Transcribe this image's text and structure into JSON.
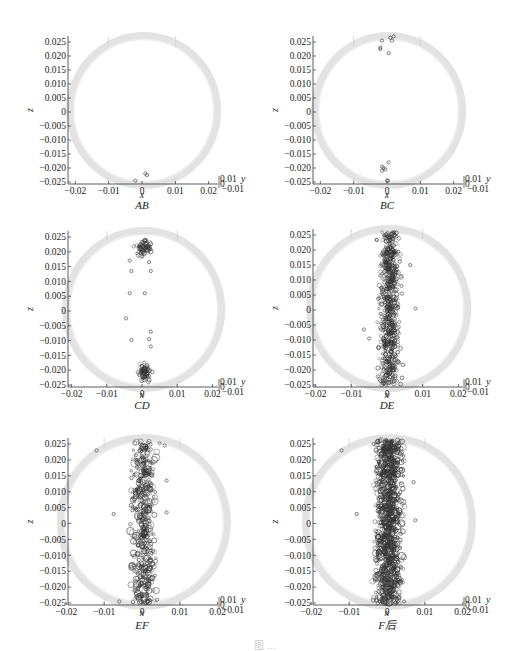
{
  "figure": {
    "caption": "图  …",
    "ring_color": "#d9d9d9",
    "marker_color": "#333333"
  },
  "chart_data": [
    {
      "type": "scatter",
      "title": "AB",
      "xlabel": "x",
      "ylabel": "z",
      "zlabel": "y",
      "xlim": [
        -0.026,
        0.026
      ],
      "ylim": [
        -0.026,
        0.027
      ],
      "xticks": [
        "-0.02",
        "-0.01",
        "0",
        "0.01",
        "0.02"
      ],
      "yticks": [
        "0.025",
        "0.020",
        "0.015",
        "0.010",
        "0.005",
        "0",
        "-0.005",
        "-0.010",
        "-0.015",
        "-0.020",
        "-0.025"
      ],
      "ytick_side": [
        "0.01",
        "0",
        "-0.01"
      ],
      "points": [
        [
          0.001,
          -0.022
        ],
        [
          0.0015,
          -0.0225
        ],
        [
          -0.002,
          -0.0245
        ]
      ],
      "clusters": []
    },
    {
      "type": "scatter",
      "title": "BC",
      "xlabel": "x",
      "ylabel": "z",
      "zlabel": "y",
      "xlim": [
        -0.026,
        0.026
      ],
      "ylim": [
        -0.026,
        0.027
      ],
      "xticks": [
        "-0.02",
        "-0.01",
        "0",
        "0.01",
        "0.02"
      ],
      "yticks": [
        "0.025",
        "0.020",
        "0.015",
        "0.010",
        "0.005",
        "0",
        "-0.005",
        "-0.010",
        "-0.015",
        "-0.020",
        "-0.025"
      ],
      "ytick_side": [
        "0.01",
        "0",
        "-0.01"
      ],
      "points": [
        [
          -0.0015,
          0.0255
        ],
        [
          0.0015,
          0.0255
        ],
        [
          0.001,
          0.0265
        ],
        [
          0.002,
          0.027
        ],
        [
          -0.002,
          0.0225
        ],
        [
          -0.002,
          0.023
        ],
        [
          0.0005,
          0.021
        ],
        [
          0.0005,
          -0.018
        ],
        [
          -0.0015,
          -0.0195
        ],
        [
          -0.001,
          -0.02
        ],
        [
          -0.0015,
          -0.021
        ],
        [
          -0.0005,
          -0.0205
        ],
        [
          0.0,
          -0.0245
        ],
        [
          0.0003,
          -0.0245
        ]
      ],
      "clusters": []
    },
    {
      "type": "scatter",
      "title": "CD",
      "xlabel": "x",
      "ylabel": "z",
      "zlabel": "y",
      "xlim": [
        -0.026,
        0.026
      ],
      "ylim": [
        -0.026,
        0.027
      ],
      "xticks": [
        "-0.02",
        "-0.01",
        "0",
        "0.01",
        "0.02"
      ],
      "yticks": [
        "0.025",
        "0.020",
        "0.015",
        "0.010",
        "0.005",
        "0",
        "-0.005",
        "-0.010",
        "-0.015",
        "-0.020",
        "-0.025"
      ],
      "ytick_side": [
        "0.01",
        "0",
        "-0.01"
      ],
      "points": [
        [
          -0.0035,
          0.006
        ],
        [
          0.0008,
          0.006
        ],
        [
          -0.0045,
          -0.0025
        ],
        [
          0.0025,
          -0.007
        ],
        [
          0.002,
          -0.0095
        ],
        [
          -0.003,
          -0.0098
        ],
        [
          0.0025,
          -0.012
        ],
        [
          -0.003,
          0.0135
        ],
        [
          0.0025,
          0.0135
        ],
        [
          -0.0035,
          0.017
        ],
        [
          0.002,
          0.0165
        ]
      ],
      "clusters": [
        {
          "cx": 0.0005,
          "cz": 0.0215,
          "sx": 0.0016,
          "sz": 0.0025,
          "n": 60,
          "seed": 11
        },
        {
          "cx": 0.0008,
          "cz": -0.0205,
          "sx": 0.0013,
          "sz": 0.0022,
          "n": 60,
          "seed": 12
        }
      ]
    },
    {
      "type": "scatter",
      "title": "DE",
      "xlabel": "x",
      "ylabel": "z",
      "zlabel": "y",
      "xlim": [
        -0.026,
        0.026
      ],
      "ylim": [
        -0.026,
        0.027
      ],
      "xticks": [
        "-0.02",
        "-0.01",
        "0",
        "0.01",
        "0.02"
      ],
      "yticks": [
        "0.025",
        "0.020",
        "0.015",
        "0.010",
        "0.005",
        "0",
        "-0.005",
        "-0.010",
        "-0.015",
        "-0.020",
        "-0.025"
      ],
      "ytick_side": [
        "0.01",
        "0",
        "-0.01"
      ],
      "points": [
        [
          0.0065,
          0.015
        ],
        [
          0.008,
          0.0005
        ],
        [
          -0.0065,
          -0.0065
        ],
        [
          -0.005,
          -0.0095
        ]
      ],
      "clusters": [
        {
          "cx": 0.0007,
          "cz": 0.0005,
          "sx": 0.0022,
          "sz": 0.0255,
          "n": 650,
          "seed": 21,
          "uniform": true
        }
      ]
    },
    {
      "type": "scatter",
      "title": "EF",
      "xlabel": "x",
      "ylabel": "z",
      "zlabel": "y",
      "xlim": [
        -0.026,
        0.026
      ],
      "ylim": [
        -0.026,
        0.027
      ],
      "xticks": [
        "-0.02",
        "-0.01",
        "0",
        "0.01",
        "0.02"
      ],
      "yticks": [
        "0.025",
        "0.020",
        "0.015",
        "0.010",
        "0.005",
        "0",
        "-0.005",
        "-0.010",
        "-0.015",
        "-0.020",
        "-0.025"
      ],
      "ytick_side": [
        "0.01",
        "0",
        "-0.01"
      ],
      "points": [
        [
          -0.012,
          0.023
        ],
        [
          0.0065,
          0.0135
        ],
        [
          0.0065,
          0.0035
        ],
        [
          -0.0075,
          0.003
        ],
        [
          0.006,
          0.0245
        ],
        [
          -0.006,
          -0.0245
        ],
        [
          0.004,
          -0.024
        ]
      ],
      "clusters": [
        {
          "cx": 0.0005,
          "cz": 0.0005,
          "sx": 0.0025,
          "sz": 0.0255,
          "n": 480,
          "seed": 31,
          "uniform": true,
          "big": true
        }
      ]
    },
    {
      "type": "scatter",
      "title": "F后",
      "xlabel": "x",
      "ylabel": "z",
      "zlabel": "y",
      "xlim": [
        -0.026,
        0.026
      ],
      "ylim": [
        -0.026,
        0.027
      ],
      "xticks": [
        "-0.02",
        "-0.01",
        "0",
        "0.01",
        "0.02"
      ],
      "yticks": [
        "0.025",
        "0.020",
        "0.015",
        "0.010",
        "0.005",
        "0",
        "-0.005",
        "-0.010",
        "-0.015",
        "-0.020",
        "-0.025"
      ],
      "ytick_side": [
        "0.01",
        "0",
        "-0.01"
      ],
      "points": [
        [
          -0.012,
          0.023
        ],
        [
          0.0075,
          0.001
        ],
        [
          0.007,
          0.013
        ],
        [
          -0.008,
          0.003
        ],
        [
          -0.0035,
          0.025
        ],
        [
          0.0045,
          -0.0245
        ]
      ],
      "clusters": [
        {
          "cx": 0.0005,
          "cz": 0.0005,
          "sx": 0.0027,
          "sz": 0.0258,
          "n": 1100,
          "seed": 41,
          "uniform": true,
          "big": true
        }
      ]
    }
  ]
}
